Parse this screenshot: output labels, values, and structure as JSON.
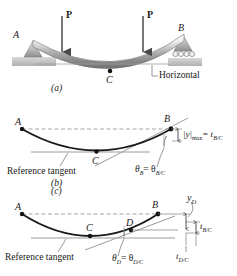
{
  "figure": {
    "colors": {
      "ink": "#1a1a1a",
      "beam_light": "#f2f2f2",
      "beam_mid": "#9a9a9a",
      "beam_dark": "#6d6d6d",
      "ground": "#c9c9c9",
      "support": "#a8a8a8",
      "thin_line": "#9c9c9c",
      "dashed": "#8e8e8e"
    }
  },
  "panel_a": {
    "caption": "(a)",
    "point_a": "A",
    "point_b": "B",
    "point_c": "C",
    "load_left": "P",
    "load_right": "P",
    "horizontal_label": "Horizontal"
  },
  "panel_b": {
    "caption": "(b)",
    "point_a": "A",
    "point_b": "B",
    "point_c": "C",
    "reference_tangent": "Reference tangent",
    "ymax_label": "|y|",
    "ymax_sub": "max",
    "ymax_eq": "= t",
    "ymax_eq_sub": "B/C",
    "theta_label": "θ",
    "theta_sub": "B",
    "theta_eq": "= θ",
    "theta_eq_sub": "B/C"
  },
  "panel_c": {
    "caption": "(c)",
    "point_a": "A",
    "point_b": "B",
    "point_c": "C",
    "point_d": "D",
    "reference_tangent": "Reference tangent",
    "yd_label": "y",
    "yd_sub": "D",
    "tbc_label": "t",
    "tbc_sub": "B/C",
    "tdc_label": "t",
    "tdc_sub": "D/C",
    "theta_label": "θ",
    "theta_sub": "D",
    "theta_eq": "= θ",
    "theta_eq_sub": "D/C"
  }
}
